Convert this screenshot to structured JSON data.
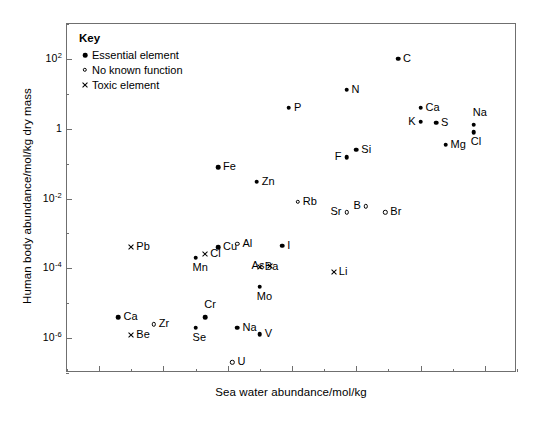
{
  "chart_data": {
    "type": "scatter",
    "title": "",
    "xlabel": "Sea water abundance/mol/kg",
    "ylabel": "Human body abundance/mol/kg dry mass",
    "xlim": [
      1e-13,
      10.0
    ],
    "ylim": [
      1e-07,
      1000.0
    ],
    "xticks": [
      {
        "value": 1e-12,
        "label": "10",
        "exp": "-12"
      },
      {
        "value": 1e-10,
        "label": "10",
        "exp": "-10"
      },
      {
        "value": 1e-08,
        "label": "10",
        "exp": "-8"
      },
      {
        "value": 1e-06,
        "label": "10",
        "exp": "-6"
      },
      {
        "value": 0.0001,
        "label": "10",
        "exp": "-4"
      },
      {
        "value": 0.01,
        "label": "10",
        "exp": "-2"
      },
      {
        "value": 1.0,
        "label": "1",
        "exp": ""
      }
    ],
    "yticks": [
      {
        "value": 100.0,
        "label": "10",
        "exp": "2"
      },
      {
        "value": 1.0,
        "label": "1",
        "exp": ""
      },
      {
        "value": 0.01,
        "label": "10",
        "exp": "-2"
      },
      {
        "value": 0.0001,
        "label": "10",
        "exp": "-4"
      },
      {
        "value": 1e-06,
        "label": "10",
        "exp": "-6"
      }
    ],
    "grid": false,
    "legend_position": "top-left",
    "legend": {
      "title": "Key",
      "entries": [
        {
          "marker": "filled-circle",
          "label": "Essential element"
        },
        {
          "marker": "open-circle",
          "label": "No known function"
        },
        {
          "marker": "cross",
          "label": "Toxic element"
        }
      ]
    },
    "series": [
      {
        "name": "Essential element",
        "marker": "filled-circle",
        "points": [
          {
            "label": "C",
            "x": 0.002,
            "y": 100.0,
            "labelpos": "right"
          },
          {
            "label": "N",
            "x": 5e-05,
            "y": 13.0,
            "labelpos": "right"
          },
          {
            "label": "P",
            "x": 8e-07,
            "y": 4.0,
            "labelpos": "right"
          },
          {
            "label": "Ca",
            "x": 0.01,
            "y": 4.0,
            "labelpos": "right"
          },
          {
            "label": "K",
            "x": 0.01,
            "y": 1.6,
            "labelpos": "left"
          },
          {
            "label": "S",
            "x": 0.03,
            "y": 1.5,
            "labelpos": "right"
          },
          {
            "label": "Na",
            "x": 0.45,
            "y": 1.3,
            "labelpos": "above"
          },
          {
            "label": "Cl",
            "x": 0.45,
            "y": 0.8,
            "labelpos": "below"
          },
          {
            "label": "Mg",
            "x": 0.06,
            "y": 0.35,
            "labelpos": "right"
          },
          {
            "label": "Si",
            "x": 0.0001,
            "y": 0.25,
            "labelpos": "right"
          },
          {
            "label": "F",
            "x": 5e-05,
            "y": 0.15,
            "labelpos": "left"
          },
          {
            "label": "Fe",
            "x": 5e-09,
            "y": 0.08,
            "labelpos": "right"
          },
          {
            "label": "Zn",
            "x": 8e-08,
            "y": 0.03,
            "labelpos": "right"
          },
          {
            "label": "Cu",
            "x": 5e-09,
            "y": 0.0004,
            "labelpos": "right"
          },
          {
            "label": "I",
            "x": 5e-07,
            "y": 0.00045,
            "labelpos": "right"
          },
          {
            "label": "Mn",
            "x": 1e-09,
            "y": 0.0002,
            "labelpos": "below"
          },
          {
            "label": "Mo",
            "x": 1e-07,
            "y": 3e-05,
            "labelpos": "below"
          },
          {
            "label": "Ca",
            "x": 4e-12,
            "y": 4e-06,
            "labelpos": "right"
          },
          {
            "label": "Cr",
            "x": 2e-09,
            "y": 4e-06,
            "labelpos": "above"
          },
          {
            "label": "Se",
            "x": 1e-09,
            "y": 2e-06,
            "labelpos": "below"
          },
          {
            "label": "Na",
            "x": 2e-08,
            "y": 2e-06,
            "labelpos": "right"
          },
          {
            "label": "V",
            "x": 1e-07,
            "y": 1.3e-06,
            "labelpos": "right"
          }
        ]
      },
      {
        "name": "No known function",
        "marker": "open-circle",
        "points": [
          {
            "label": "Rb",
            "x": 1.5e-06,
            "y": 0.008,
            "labelpos": "right"
          },
          {
            "label": "B",
            "x": 0.0002,
            "y": 0.006,
            "labelpos": "left"
          },
          {
            "label": "Sr",
            "x": 5e-05,
            "y": 0.004,
            "labelpos": "left"
          },
          {
            "label": "Br",
            "x": 0.0008,
            "y": 0.004,
            "labelpos": "right"
          },
          {
            "label": "Al",
            "x": 2e-08,
            "y": 0.0005,
            "labelpos": "right"
          },
          {
            "label": "Zr",
            "x": 5e-11,
            "y": 2.5e-06,
            "labelpos": "right"
          },
          {
            "label": "U",
            "x": 1.4e-08,
            "y": 2e-07,
            "labelpos": "right"
          }
        ]
      },
      {
        "name": "Toxic element",
        "marker": "cross",
        "points": [
          {
            "label": "Pb",
            "x": 1e-11,
            "y": 0.0004,
            "labelpos": "right"
          },
          {
            "label": "Cl",
            "x": 2e-09,
            "y": 0.00025,
            "labelpos": "right"
          },
          {
            "label": "As",
            "x": 2e-07,
            "y": 0.00012,
            "labelpos": "left"
          },
          {
            "label": "Ba",
            "x": 1e-07,
            "y": 0.00011,
            "labelpos": "right"
          },
          {
            "label": "Li",
            "x": 2e-05,
            "y": 8e-05,
            "labelpos": "right"
          },
          {
            "label": "Be",
            "x": 1e-11,
            "y": 1.2e-06,
            "labelpos": "right"
          }
        ]
      }
    ]
  }
}
